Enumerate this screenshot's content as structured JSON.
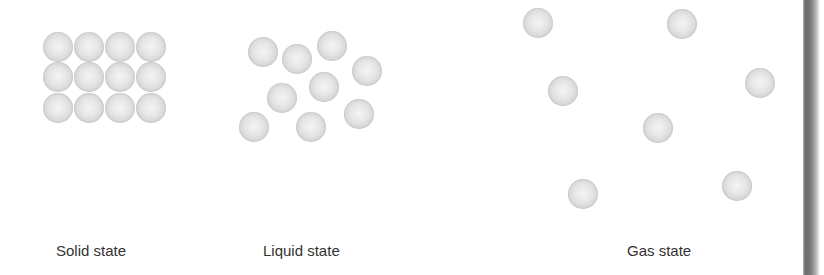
{
  "diagram": {
    "particle_color": "#dcdcdc",
    "label_color": "#333333",
    "edge_bar_color": "#6a6a6a",
    "particle_diameter": 30,
    "states": [
      {
        "id": "solid",
        "label": "Solid state",
        "label_x": 56,
        "particles": [
          [
            58,
            47
          ],
          [
            89,
            47
          ],
          [
            120,
            47
          ],
          [
            151,
            47
          ],
          [
            58,
            77
          ],
          [
            89,
            77
          ],
          [
            120,
            77
          ],
          [
            151,
            77
          ],
          [
            58,
            108
          ],
          [
            89,
            108
          ],
          [
            120,
            108
          ],
          [
            151,
            108
          ]
        ]
      },
      {
        "id": "liquid",
        "label": "Liquid state",
        "label_x": 263,
        "particles": [
          [
            263,
            52
          ],
          [
            297,
            59
          ],
          [
            332,
            46
          ],
          [
            367,
            71
          ],
          [
            324,
            87
          ],
          [
            282,
            98
          ],
          [
            254,
            127
          ],
          [
            311,
            127
          ],
          [
            359,
            114
          ]
        ]
      },
      {
        "id": "gas",
        "label": "Gas state",
        "label_x": 627,
        "particles": [
          [
            538,
            23
          ],
          [
            682,
            24
          ],
          [
            563,
            91
          ],
          [
            760,
            83
          ],
          [
            658,
            128
          ],
          [
            583,
            194
          ],
          [
            737,
            186
          ]
        ]
      }
    ]
  }
}
